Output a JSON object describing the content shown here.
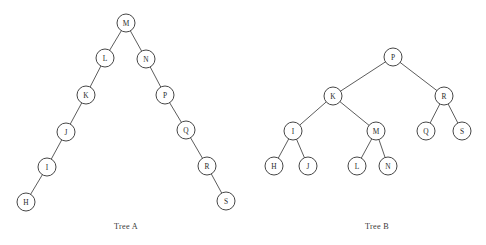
{
  "figure": {
    "background_color": "#ffffff",
    "node_fill": "#ffffff",
    "node_stroke": "#3c3c3c",
    "edge_stroke": "#4a4a4a",
    "text_color": "#2b2b2b",
    "node_radius": 9
  },
  "trees": [
    {
      "id": "tree-a",
      "caption": "Tree A",
      "caption_x": 126,
      "caption_y": 229,
      "root": "M",
      "nodes": [
        {
          "label": "M",
          "x": 126,
          "y": 23
        },
        {
          "label": "L",
          "x": 105,
          "y": 58
        },
        {
          "label": "N",
          "x": 146,
          "y": 59
        },
        {
          "label": "K",
          "x": 86,
          "y": 95
        },
        {
          "label": "P",
          "x": 165,
          "y": 95
        },
        {
          "label": "J",
          "x": 66,
          "y": 132
        },
        {
          "label": "Q",
          "x": 186,
          "y": 130
        },
        {
          "label": "I",
          "x": 47,
          "y": 167
        },
        {
          "label": "R",
          "x": 207,
          "y": 166
        },
        {
          "label": "H",
          "x": 26,
          "y": 202
        },
        {
          "label": "S",
          "x": 226,
          "y": 201
        }
      ],
      "edges": [
        {
          "from": "M",
          "to": "L"
        },
        {
          "from": "M",
          "to": "N"
        },
        {
          "from": "L",
          "to": "K"
        },
        {
          "from": "K",
          "to": "J"
        },
        {
          "from": "J",
          "to": "I"
        },
        {
          "from": "I",
          "to": "H"
        },
        {
          "from": "N",
          "to": "P"
        },
        {
          "from": "P",
          "to": "Q"
        },
        {
          "from": "Q",
          "to": "R"
        },
        {
          "from": "R",
          "to": "S"
        }
      ]
    },
    {
      "id": "tree-b",
      "caption": "Tree B",
      "caption_x": 377,
      "caption_y": 229,
      "root": "P",
      "nodes": [
        {
          "label": "P",
          "x": 393,
          "y": 57
        },
        {
          "label": "K",
          "x": 333,
          "y": 96
        },
        {
          "label": "R",
          "x": 444,
          "y": 96
        },
        {
          "label": "I",
          "x": 293,
          "y": 131
        },
        {
          "label": "M",
          "x": 376,
          "y": 131
        },
        {
          "label": "Q",
          "x": 426,
          "y": 131
        },
        {
          "label": "S",
          "x": 462,
          "y": 131
        },
        {
          "label": "H",
          "x": 274,
          "y": 166
        },
        {
          "label": "J",
          "x": 308,
          "y": 166
        },
        {
          "label": "L",
          "x": 357,
          "y": 166
        },
        {
          "label": "N",
          "x": 388,
          "y": 166
        }
      ],
      "edges": [
        {
          "from": "P",
          "to": "K"
        },
        {
          "from": "P",
          "to": "R"
        },
        {
          "from": "K",
          "to": "I"
        },
        {
          "from": "K",
          "to": "M"
        },
        {
          "from": "R",
          "to": "Q"
        },
        {
          "from": "R",
          "to": "S"
        },
        {
          "from": "I",
          "to": "H"
        },
        {
          "from": "I",
          "to": "J"
        },
        {
          "from": "M",
          "to": "L"
        },
        {
          "from": "M",
          "to": "N"
        }
      ]
    }
  ]
}
